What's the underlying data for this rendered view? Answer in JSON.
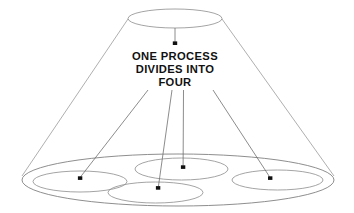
{
  "figure": {
    "title": "",
    "background_color": "#ffffff",
    "line_color": "#8d8d8d",
    "text_color": "#111111",
    "arrow_color": "#6f6f6f",
    "width": 354,
    "height": 213
  },
  "caption": {
    "line1": "ONE PROCESS",
    "line2": "DIVIDES  INTO",
    "line3": "FOUR",
    "full_text": "ONE PROCESS DIVIDES INTO FOUR"
  },
  "shapes": {
    "top_ellipse": {
      "label": "single-process-ellipse",
      "cx": 175,
      "cy": 18.5,
      "rx": 47,
      "ry": 9.5
    },
    "bottom_ellipse": {
      "label": "outcome-group-ellipse",
      "cx": 178,
      "cy": 180,
      "rx": 156,
      "ry": 26
    },
    "child_ellipses": [
      {
        "label": "process-one-ellipse",
        "cx": 80,
        "cy": 181.5,
        "rx": 47,
        "ry": 10.5
      },
      {
        "label": "process-two-ellipse",
        "cx": 181.5,
        "cy": 169,
        "rx": 46.5,
        "ry": 11
      },
      {
        "label": "process-three-ellipse",
        "cx": 155.5,
        "cy": 192.5,
        "rx": 47.5,
        "ry": 10.5
      },
      {
        "label": "process-four-ellipse",
        "cx": 277.5,
        "cy": 180,
        "rx": 45.5,
        "ry": 10
      }
    ],
    "cone_edges": [
      {
        "label": "cone-left-edge",
        "x1": 128,
        "y1": 19,
        "x2": 22,
        "y2": 176
      },
      {
        "label": "cone-right-edge",
        "x1": 222,
        "y1": 19,
        "x2": 334,
        "y2": 176
      }
    ]
  },
  "arrows": [
    {
      "label": "arrow-to-caption",
      "from_x": 175,
      "from_y": 28,
      "to_x": 175,
      "to_y": 44
    },
    {
      "label": "arrow-to-process-one",
      "from_x": 148,
      "from_y": 90,
      "to_x": 80,
      "to_y": 178
    },
    {
      "label": "arrow-to-process-three",
      "from_x": 172,
      "from_y": 90,
      "to_x": 158,
      "to_y": 188
    },
    {
      "label": "arrow-to-process-two",
      "from_x": 183.5,
      "from_y": 90,
      "to_x": 183,
      "to_y": 167
    },
    {
      "label": "arrow-to-process-four",
      "from_x": 213,
      "from_y": 90,
      "to_x": 270,
      "to_y": 178
    }
  ],
  "caption_layout": {
    "x": 175,
    "line1_y": 60,
    "line2_y": 73,
    "line3_y": 86
  }
}
